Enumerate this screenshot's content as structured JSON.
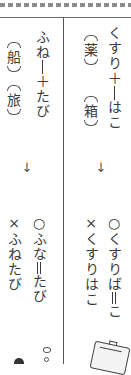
{
  "columns": [
    {
      "id": "kusuri",
      "compound_top": "くすり",
      "plus": "＋",
      "compound_bottom": "はこ",
      "kanji_first": "薬",
      "kanji_second": "箱",
      "arrow": "↓",
      "correct_mark": "○",
      "correct_pre": "くすり",
      "correct_voiced": "ば",
      "correct_post": "こ",
      "wrong_mark": "×",
      "wrong_reading": "くすりはこ"
    },
    {
      "id": "funatabi",
      "compound_top": "ふね",
      "plus": "＋",
      "compound_bottom": "たび",
      "kanji_first": "船",
      "kanji_second": "旅",
      "arrow": "↓",
      "correct_mark": "○",
      "correct_pre": "ふ",
      "correct_voiced": "な",
      "correct_post": "たび",
      "wrong_mark": "×",
      "wrong_reading": "ふねたび"
    }
  ],
  "illustrations": [
    "medicine-box-icon",
    "ship-icon",
    "bubbles-icon"
  ]
}
